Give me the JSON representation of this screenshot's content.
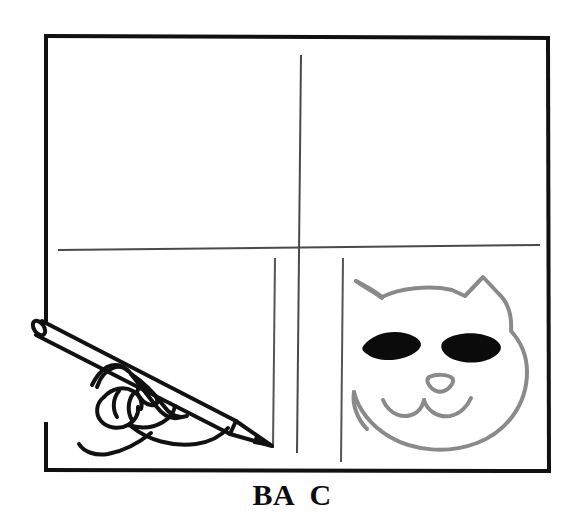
{
  "figure": {
    "type": "line-drawing",
    "background_color": "#ffffff",
    "caption": "BA  C",
    "caption_labels": [
      "B",
      "A",
      "C"
    ],
    "frame": {
      "name": "page-border-rectangle",
      "color": "#111111",
      "stroke_width": 4,
      "left": 46,
      "top": 35,
      "right": 548,
      "bottom": 472,
      "note": "left edge interrupted where pencil crosses it"
    },
    "guide_lines": {
      "horizontal_divider": {
        "color": "#4a4a4a",
        "stroke_width": 2,
        "x1": 58,
        "y1": 250,
        "x2": 540,
        "y2": 245
      },
      "vertical_center": {
        "color": "#4a4a4a",
        "stroke_width": 2,
        "x1": 301,
        "y1": 55,
        "x2": 297,
        "y2": 453
      },
      "vertical_left": {
        "color": "#555555",
        "stroke_width": 2,
        "x1": 275,
        "y1": 258,
        "x2": 273,
        "y2": 448
      },
      "vertical_right": {
        "color": "#555555",
        "stroke_width": 2,
        "x1": 343,
        "y1": 258,
        "x2": 341,
        "y2": 462
      }
    },
    "hand": {
      "name": "hand-holding-pencil",
      "color": "#111111",
      "stroke_width": 4,
      "description": "left-facing hand gripping a pencil angled down to the right"
    },
    "pencil": {
      "name": "pencil",
      "color": "#111111",
      "stroke_width": 4,
      "eraser_end": [
        36,
        322
      ],
      "tip_end": [
        272,
        446
      ]
    },
    "cat": {
      "name": "cat-face-drawing",
      "outline_color": "#8a8a8a",
      "outline_stroke_width": 4,
      "eye_color": "#0b0b0b",
      "center": [
        445,
        365
      ],
      "features": [
        "left-ear",
        "right-ear",
        "head",
        "left-eye",
        "right-eye",
        "nose",
        "mouth"
      ]
    }
  }
}
